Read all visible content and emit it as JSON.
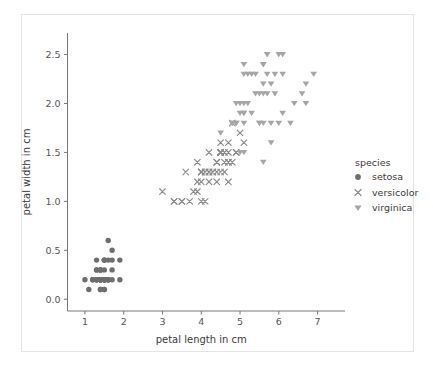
{
  "chart_data": {
    "type": "scatter",
    "title": "",
    "xlabel": "petal length in cm",
    "ylabel": "petal width in cm",
    "xlim": [
      0.55,
      7.45
    ],
    "ylim": [
      -0.12,
      2.72
    ],
    "xticks": [
      "1",
      "2",
      "3",
      "4",
      "5",
      "6",
      "7"
    ],
    "xtick_values": [
      1,
      2,
      3,
      4,
      5,
      6,
      7
    ],
    "yticks": [
      "0.0",
      "0.5",
      "1.0",
      "1.5",
      "2.0",
      "2.5"
    ],
    "ytick_values": [
      0.0,
      0.5,
      1.0,
      1.5,
      2.0,
      2.5
    ],
    "grid": false,
    "legend": {
      "title": "species",
      "position": "right-outside",
      "entries": [
        {
          "label": "setosa",
          "marker": "circle",
          "color": "#6e6e6e"
        },
        {
          "label": "versicolor",
          "marker": "x",
          "color": "#8a8a8a"
        },
        {
          "label": "virginica",
          "marker": "triangle-down",
          "color": "#a6a6a6"
        }
      ]
    },
    "series": [
      {
        "name": "setosa",
        "marker": "circle",
        "color": "#6e6e6e",
        "points": [
          [
            1.4,
            0.2
          ],
          [
            1.4,
            0.2
          ],
          [
            1.3,
            0.2
          ],
          [
            1.5,
            0.2
          ],
          [
            1.4,
            0.2
          ],
          [
            1.7,
            0.4
          ],
          [
            1.4,
            0.3
          ],
          [
            1.5,
            0.2
          ],
          [
            1.4,
            0.2
          ],
          [
            1.5,
            0.1
          ],
          [
            1.5,
            0.2
          ],
          [
            1.6,
            0.2
          ],
          [
            1.4,
            0.1
          ],
          [
            1.1,
            0.1
          ],
          [
            1.2,
            0.2
          ],
          [
            1.5,
            0.4
          ],
          [
            1.3,
            0.4
          ],
          [
            1.4,
            0.3
          ],
          [
            1.7,
            0.3
          ],
          [
            1.5,
            0.3
          ],
          [
            1.7,
            0.2
          ],
          [
            1.5,
            0.4
          ],
          [
            1.0,
            0.2
          ],
          [
            1.7,
            0.5
          ],
          [
            1.9,
            0.2
          ],
          [
            1.6,
            0.2
          ],
          [
            1.6,
            0.4
          ],
          [
            1.5,
            0.2
          ],
          [
            1.4,
            0.2
          ],
          [
            1.6,
            0.2
          ],
          [
            1.6,
            0.2
          ],
          [
            1.5,
            0.4
          ],
          [
            1.5,
            0.1
          ],
          [
            1.4,
            0.2
          ],
          [
            1.5,
            0.2
          ],
          [
            1.2,
            0.2
          ],
          [
            1.3,
            0.2
          ],
          [
            1.4,
            0.1
          ],
          [
            1.3,
            0.2
          ],
          [
            1.5,
            0.2
          ],
          [
            1.3,
            0.3
          ],
          [
            1.3,
            0.3
          ],
          [
            1.3,
            0.2
          ],
          [
            1.6,
            0.6
          ],
          [
            1.9,
            0.4
          ],
          [
            1.4,
            0.3
          ],
          [
            1.6,
            0.2
          ],
          [
            1.4,
            0.2
          ],
          [
            1.5,
            0.2
          ],
          [
            1.4,
            0.2
          ]
        ]
      },
      {
        "name": "versicolor",
        "marker": "x",
        "color": "#8a8a8a",
        "points": [
          [
            4.7,
            1.4
          ],
          [
            4.5,
            1.5
          ],
          [
            4.9,
            1.5
          ],
          [
            4.0,
            1.3
          ],
          [
            4.6,
            1.5
          ],
          [
            4.5,
            1.3
          ],
          [
            4.7,
            1.6
          ],
          [
            3.3,
            1.0
          ],
          [
            4.6,
            1.3
          ],
          [
            3.9,
            1.4
          ],
          [
            3.5,
            1.0
          ],
          [
            4.2,
            1.5
          ],
          [
            4.0,
            1.0
          ],
          [
            4.7,
            1.4
          ],
          [
            3.6,
            1.3
          ],
          [
            4.4,
            1.4
          ],
          [
            4.5,
            1.5
          ],
          [
            4.1,
            1.0
          ],
          [
            4.5,
            1.5
          ],
          [
            3.9,
            1.1
          ],
          [
            4.8,
            1.8
          ],
          [
            4.0,
            1.3
          ],
          [
            4.9,
            1.5
          ],
          [
            4.7,
            1.2
          ],
          [
            4.3,
            1.3
          ],
          [
            4.4,
            1.4
          ],
          [
            4.8,
            1.4
          ],
          [
            5.0,
            1.7
          ],
          [
            4.5,
            1.5
          ],
          [
            3.5,
            1.0
          ],
          [
            3.8,
            1.1
          ],
          [
            3.7,
            1.0
          ],
          [
            3.9,
            1.2
          ],
          [
            5.1,
            1.6
          ],
          [
            4.5,
            1.5
          ],
          [
            4.5,
            1.6
          ],
          [
            4.7,
            1.5
          ],
          [
            4.4,
            1.3
          ],
          [
            4.1,
            1.3
          ],
          [
            4.0,
            1.3
          ],
          [
            4.4,
            1.2
          ],
          [
            4.6,
            1.4
          ],
          [
            4.0,
            1.2
          ],
          [
            3.3,
            1.0
          ],
          [
            4.2,
            1.3
          ],
          [
            4.2,
            1.2
          ],
          [
            4.2,
            1.3
          ],
          [
            4.3,
            1.3
          ],
          [
            3.0,
            1.1
          ],
          [
            4.1,
            1.3
          ]
        ]
      },
      {
        "name": "virginica",
        "marker": "triangle-down",
        "color": "#a6a6a6",
        "points": [
          [
            6.0,
            2.5
          ],
          [
            5.1,
            1.9
          ],
          [
            5.9,
            2.1
          ],
          [
            5.6,
            1.8
          ],
          [
            5.8,
            2.2
          ],
          [
            6.6,
            2.1
          ],
          [
            4.5,
            1.7
          ],
          [
            6.3,
            1.8
          ],
          [
            5.8,
            1.8
          ],
          [
            6.1,
            2.5
          ],
          [
            5.1,
            2.0
          ],
          [
            5.3,
            1.9
          ],
          [
            5.5,
            2.1
          ],
          [
            5.0,
            2.0
          ],
          [
            5.1,
            2.4
          ],
          [
            5.3,
            2.3
          ],
          [
            5.5,
            1.8
          ],
          [
            6.7,
            2.2
          ],
          [
            6.9,
            2.3
          ],
          [
            5.0,
            1.5
          ],
          [
            5.7,
            2.3
          ],
          [
            4.9,
            2.0
          ],
          [
            6.7,
            2.0
          ],
          [
            4.9,
            1.8
          ],
          [
            5.7,
            2.1
          ],
          [
            6.0,
            1.8
          ],
          [
            4.8,
            1.8
          ],
          [
            4.9,
            1.8
          ],
          [
            5.6,
            2.1
          ],
          [
            5.8,
            1.6
          ],
          [
            6.1,
            1.9
          ],
          [
            6.4,
            2.0
          ],
          [
            5.6,
            2.2
          ],
          [
            5.1,
            1.5
          ],
          [
            5.6,
            1.4
          ],
          [
            6.1,
            2.3
          ],
          [
            5.6,
            2.4
          ],
          [
            5.5,
            1.8
          ],
          [
            4.8,
            1.8
          ],
          [
            5.4,
            2.1
          ],
          [
            5.6,
            2.4
          ],
          [
            5.1,
            2.3
          ],
          [
            5.1,
            1.9
          ],
          [
            5.9,
            2.3
          ],
          [
            5.7,
            2.5
          ],
          [
            5.2,
            2.3
          ],
          [
            5.0,
            1.9
          ],
          [
            5.2,
            2.0
          ],
          [
            5.4,
            2.3
          ],
          [
            5.1,
            1.8
          ]
        ]
      }
    ]
  }
}
